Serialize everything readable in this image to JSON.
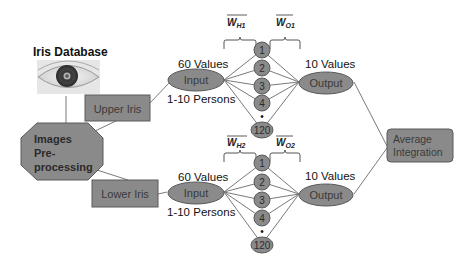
{
  "diagram": {
    "title": "Iris Database",
    "colors": {
      "shape_fill": "#8a8a8a",
      "shape_stroke": "#5a5a5a",
      "line": "#7a7a7a",
      "text_dark": "#111111",
      "text_on_shape": "#3a3a3a",
      "background": "#ffffff"
    },
    "eye_image": {
      "label": "eye-image"
    },
    "preprocessing": {
      "line1": "Images",
      "line2": "Pre-",
      "line3": "processing"
    },
    "upper_branch": {
      "box_label": "Upper Iris",
      "input_label": "Input",
      "input_values": "60 Values",
      "persons": "1-10 Persons",
      "weight_hidden": "W",
      "weight_hidden_sub": "H1",
      "weight_output": "W",
      "weight_output_sub": "O1",
      "hidden_nodes": [
        "1",
        "2",
        "3",
        "4",
        "120"
      ],
      "ellipsis": "•",
      "output_label": "Output",
      "output_values": "10 Values"
    },
    "lower_branch": {
      "box_label": "Lower Iris",
      "input_label": "Input",
      "input_values": "60 Values",
      "persons": "1-10 Persons",
      "weight_hidden": "W",
      "weight_hidden_sub": "H2",
      "weight_output": "W",
      "weight_output_sub": "O2",
      "hidden_nodes": [
        "1",
        "2",
        "3",
        "4",
        "120"
      ],
      "ellipsis": "•",
      "output_label": "Output",
      "output_values": "10 Values"
    },
    "integration": {
      "line1": "Average",
      "line2": "Integration"
    }
  }
}
